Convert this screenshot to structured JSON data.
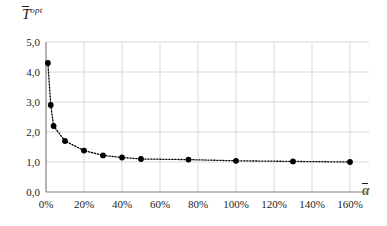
{
  "chart_data": {
    "type": "line",
    "title": "",
    "subtitle": "",
    "xlabel": "alpha-bar",
    "ylabel": "T-bar-opt",
    "xlabel_display": "α",
    "ylabel_display": "T",
    "ylabel_superscript": "opt",
    "grid": true,
    "legend": false,
    "legend_position": "none",
    "marker": "filled-circle",
    "line_style": "dotted",
    "series_color": "#000000",
    "grid_color": "#d9d9d9",
    "axis_color": "#808080",
    "xlim": [
      0,
      170
    ],
    "ylim": [
      0,
      5
    ],
    "x_unit": "percent",
    "xticks": [
      0,
      20,
      40,
      60,
      80,
      100,
      120,
      140,
      160
    ],
    "xtick_labels": [
      "0%",
      "20%",
      "40%",
      "60%",
      "80%",
      "100%",
      "120%",
      "140%",
      "160%"
    ],
    "yticks": [
      0,
      1,
      2,
      3,
      4,
      5
    ],
    "ytick_labels": [
      "0,0",
      "1,0",
      "2,0",
      "3,0",
      "4,0",
      "5,0"
    ],
    "x": [
      1,
      2.5,
      4,
      10,
      20,
      30,
      40,
      50,
      75,
      100,
      130,
      160
    ],
    "values": [
      4.3,
      2.9,
      2.2,
      1.7,
      1.38,
      1.22,
      1.15,
      1.1,
      1.08,
      1.04,
      1.02,
      1.0
    ],
    "points": [
      {
        "x": 1,
        "y": 4.3
      },
      {
        "x": 2.5,
        "y": 2.9
      },
      {
        "x": 4,
        "y": 2.2
      },
      {
        "x": 10,
        "y": 1.7
      },
      {
        "x": 20,
        "y": 1.38
      },
      {
        "x": 30,
        "y": 1.22
      },
      {
        "x": 40,
        "y": 1.15
      },
      {
        "x": 50,
        "y": 1.1
      },
      {
        "x": 75,
        "y": 1.08
      },
      {
        "x": 100,
        "y": 1.04
      },
      {
        "x": 130,
        "y": 1.02
      },
      {
        "x": 160,
        "y": 1.0
      }
    ]
  }
}
